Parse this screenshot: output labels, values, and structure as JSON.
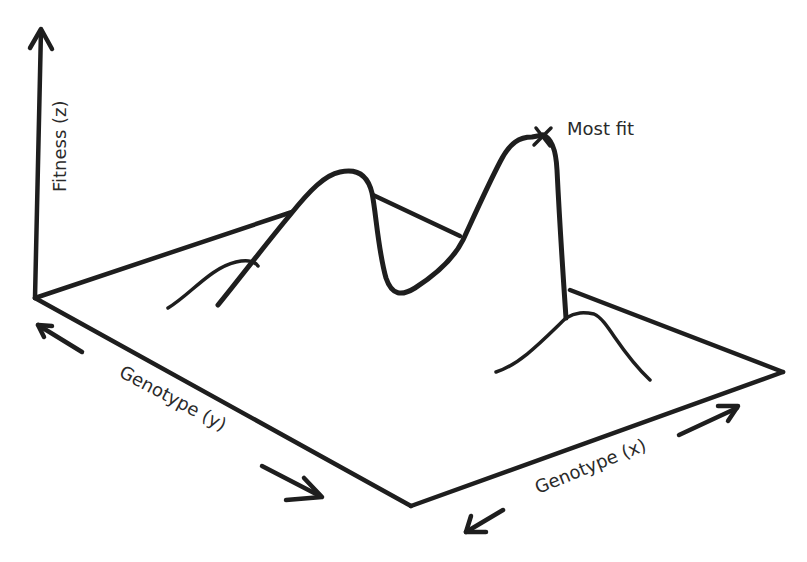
{
  "diagram": {
    "axes": {
      "z_label": "Fitness (z)",
      "y_label": "Genotype (y)",
      "x_label": "Genotype (x)"
    },
    "annotations": {
      "peak_label": "Most fit"
    },
    "colors": {
      "ink": "#1e1e1e",
      "text": "#2a2a2a",
      "background": "#ffffff"
    }
  }
}
